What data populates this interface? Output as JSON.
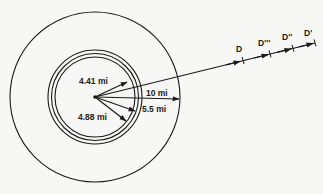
{
  "diagram": {
    "center": {
      "x": 95,
      "y": 97
    },
    "outer_circle": {
      "r": 85
    },
    "inner_circles": [
      {
        "r": 40
      },
      {
        "r": 44
      },
      {
        "r": 47.5
      }
    ],
    "radii_labels": [
      {
        "id": "r441",
        "text": "4.41 mi",
        "x": 79,
        "y": 84
      },
      {
        "id": "r10",
        "text": "10 mi",
        "x": 146,
        "y": 96
      },
      {
        "id": "r55",
        "text": "5.5 mi",
        "x": 142,
        "y": 112
      },
      {
        "id": "r488",
        "text": "4.88 mi",
        "x": 78,
        "y": 120
      }
    ],
    "distance_markers": [
      {
        "id": "D",
        "text": "D",
        "x": 236,
        "y": 52
      },
      {
        "id": "D3",
        "text": "D'''",
        "x": 258,
        "y": 46
      },
      {
        "id": "D2",
        "text": "D''",
        "x": 282,
        "y": 40
      },
      {
        "id": "D1",
        "text": "D'",
        "x": 304,
        "y": 36
      }
    ],
    "stroke_color": "#1a1a1a",
    "background_color": "#f7f7f5"
  }
}
